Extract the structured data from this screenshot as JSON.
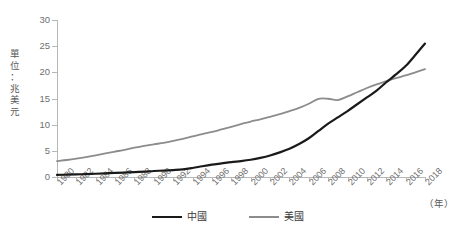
{
  "chart_data": {
    "type": "line",
    "title": "",
    "xlabel": "（年）",
    "ylabel": "單位：兆美元",
    "ylabel_chars": [
      "單",
      "位",
      "：",
      "兆",
      "美",
      "元"
    ],
    "xlim": [
      1980,
      2018
    ],
    "ylim": [
      0,
      30
    ],
    "ytick_step": 5,
    "xtick_step": 2,
    "grid": false,
    "legend_position": "bottom-center",
    "categories": [
      1980,
      1981,
      1982,
      1983,
      1984,
      1985,
      1986,
      1987,
      1988,
      1989,
      1990,
      1991,
      1992,
      1993,
      1994,
      1995,
      1996,
      1997,
      1998,
      1999,
      2000,
      2001,
      2002,
      2003,
      2004,
      2005,
      2006,
      2007,
      2008,
      2009,
      2010,
      2011,
      2012,
      2013,
      2014,
      2015,
      2016,
      2017,
      2018
    ],
    "ytick_labels": [
      "0",
      "5",
      "10",
      "15",
      "20",
      "25",
      "30"
    ],
    "xtick_labels": [
      "1980",
      "1982",
      "1984",
      "1986",
      "1988",
      "1990",
      "1992",
      "1994",
      "1996",
      "1998",
      "2000",
      "2002",
      "2004",
      "2006",
      "2008",
      "2010",
      "2012",
      "2014",
      "2016",
      "2018"
    ],
    "series": [
      {
        "name": "中國",
        "color": "#1a1a1a",
        "width": 2.2,
        "values": [
          0.4,
          0.45,
          0.5,
          0.55,
          0.62,
          0.7,
          0.78,
          0.85,
          0.95,
          1.02,
          1.15,
          1.22,
          1.32,
          1.45,
          1.72,
          2.05,
          2.35,
          2.6,
          2.85,
          3.05,
          3.3,
          3.65,
          4.1,
          4.7,
          5.4,
          6.3,
          7.4,
          8.8,
          10.2,
          11.4,
          12.6,
          13.9,
          15.2,
          16.5,
          18.1,
          19.6,
          21.2,
          23.3,
          25.5
        ]
      },
      {
        "name": "美國",
        "color": "#8c8c8c",
        "width": 1.8,
        "values": [
          3.05,
          3.25,
          3.5,
          3.8,
          4.15,
          4.5,
          4.85,
          5.2,
          5.6,
          5.95,
          6.25,
          6.5,
          6.9,
          7.3,
          7.75,
          8.2,
          8.6,
          9.1,
          9.6,
          10.1,
          10.6,
          11.0,
          11.5,
          12.0,
          12.6,
          13.2,
          14.0,
          14.95,
          14.95,
          14.7,
          15.4,
          16.2,
          17.0,
          17.7,
          18.3,
          18.9,
          19.4,
          20.0,
          20.6
        ]
      }
    ],
    "legend": [
      {
        "label": "中國",
        "color": "#1a1a1a",
        "width": 2.4
      },
      {
        "label": "美國",
        "color": "#8c8c8c",
        "width": 2.0
      }
    ],
    "axis_color": "#b7b7b7",
    "tick_text_color": "#6f6f6f"
  }
}
